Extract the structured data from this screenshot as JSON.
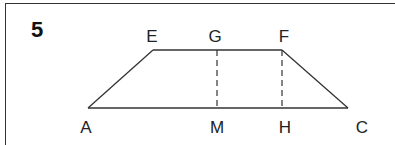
{
  "question": {
    "number": "5"
  },
  "diagram": {
    "type": "trapezoid",
    "points": {
      "A": {
        "label": "A",
        "x": 88,
        "y": 108,
        "lx": 86,
        "ly": 118
      },
      "E": {
        "label": "E",
        "x": 153,
        "y": 50,
        "lx": 152,
        "ly": 27
      },
      "G": {
        "label": "G",
        "x": 217,
        "y": 50,
        "lx": 215,
        "ly": 27
      },
      "F": {
        "label": "F",
        "x": 282,
        "y": 50,
        "lx": 284,
        "ly": 27
      },
      "M": {
        "label": "M",
        "x": 217,
        "y": 108,
        "lx": 217,
        "ly": 118
      },
      "H": {
        "label": "H",
        "x": 282,
        "y": 108,
        "lx": 285,
        "ly": 118
      },
      "C": {
        "label": "C",
        "x": 348,
        "y": 108,
        "lx": 362,
        "ly": 118
      }
    },
    "solid_segments": [
      [
        "A",
        "E"
      ],
      [
        "E",
        "F"
      ],
      [
        "F",
        "C"
      ],
      [
        "A",
        "C"
      ]
    ],
    "dashed_segments": [
      [
        "G",
        "M"
      ],
      [
        "F",
        "H"
      ]
    ],
    "stroke_color": "#333333"
  }
}
